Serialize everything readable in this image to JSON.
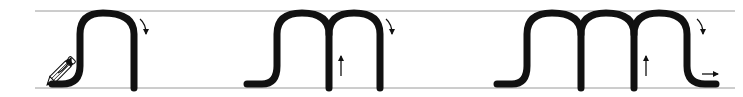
{
  "diagram": {
    "title": "Handwriting practice: letters n, m and triple-hump pattern",
    "guide_lines": {
      "top_y": 11,
      "bottom_y": 88,
      "x_start": 35,
      "x_end": 735,
      "color": "#9a9a9a"
    },
    "stroke_color": "#111111",
    "stroke_width": 7,
    "figures": [
      {
        "id": "figure-1",
        "label": "single hump (n)",
        "humps": 1,
        "direction_arrows": [
          "up-curve-right at start",
          "clockwise at top-right"
        ]
      },
      {
        "id": "figure-2",
        "label": "double hump (m)",
        "humps": 2,
        "direction_arrows": [
          "up arrow inside second hump",
          "clockwise at top-right"
        ]
      },
      {
        "id": "figure-3",
        "label": "triple hump",
        "humps": 3,
        "direction_arrows": [
          "up arrow inside third hump",
          "clockwise at top-right",
          "right arrow at exit"
        ]
      }
    ],
    "pencil_icon": "pencil"
  }
}
